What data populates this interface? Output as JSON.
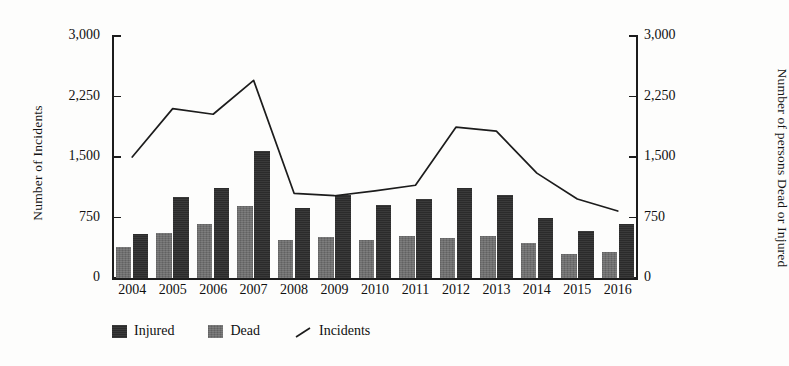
{
  "chart_data": {
    "type": "bar",
    "title": "",
    "subtitle": "",
    "xlabel": "",
    "ylabel": "Number of Incidents",
    "y2label": "Number of persons Dead or Injured",
    "categories": [
      "2004",
      "2005",
      "2006",
      "2007",
      "2008",
      "2009",
      "2010",
      "2011",
      "2012",
      "2013",
      "2014",
      "2015",
      "2016"
    ],
    "ylim": [
      0,
      3000
    ],
    "y2lim": [
      0,
      3000
    ],
    "yticks": [
      "0",
      "750",
      "1,500",
      "2,250",
      "3,000"
    ],
    "ytick_values": [
      0,
      750,
      1500,
      2250,
      3000
    ],
    "y2ticks": [
      "0",
      "750",
      "1,500",
      "2,250",
      "3,000"
    ],
    "grid": false,
    "legend_position": "bottom-left",
    "series": [
      {
        "name": "Injured",
        "type": "bar",
        "axis": "right",
        "color": "#2b2b2b",
        "values": [
          550,
          1000,
          1120,
          1570,
          870,
          1030,
          910,
          980,
          1120,
          1030,
          750,
          580,
          670
        ]
      },
      {
        "name": "Dead",
        "type": "bar",
        "axis": "right",
        "color": "#6e6e6e",
        "values": [
          380,
          560,
          670,
          890,
          470,
          510,
          470,
          520,
          500,
          520,
          440,
          300,
          320
        ]
      },
      {
        "name": "Incidents",
        "type": "line",
        "axis": "left",
        "color": "#1c1c1c",
        "values": [
          1500,
          2100,
          2030,
          2450,
          1050,
          1020,
          1080,
          1150,
          1870,
          1820,
          1300,
          980,
          830
        ]
      }
    ]
  },
  "legend": {
    "items": [
      {
        "label": "Injured",
        "marker": "square-dark",
        "color": "#2b2b2b"
      },
      {
        "label": "Dead",
        "marker": "square-gray",
        "color": "#6e6e6e"
      },
      {
        "label": "Incidents",
        "marker": "line-slash",
        "color": "#1c1c1c"
      }
    ]
  },
  "axes": {
    "left_title": "Number of Incidents",
    "right_title": "Number of persons Dead or Injured"
  }
}
